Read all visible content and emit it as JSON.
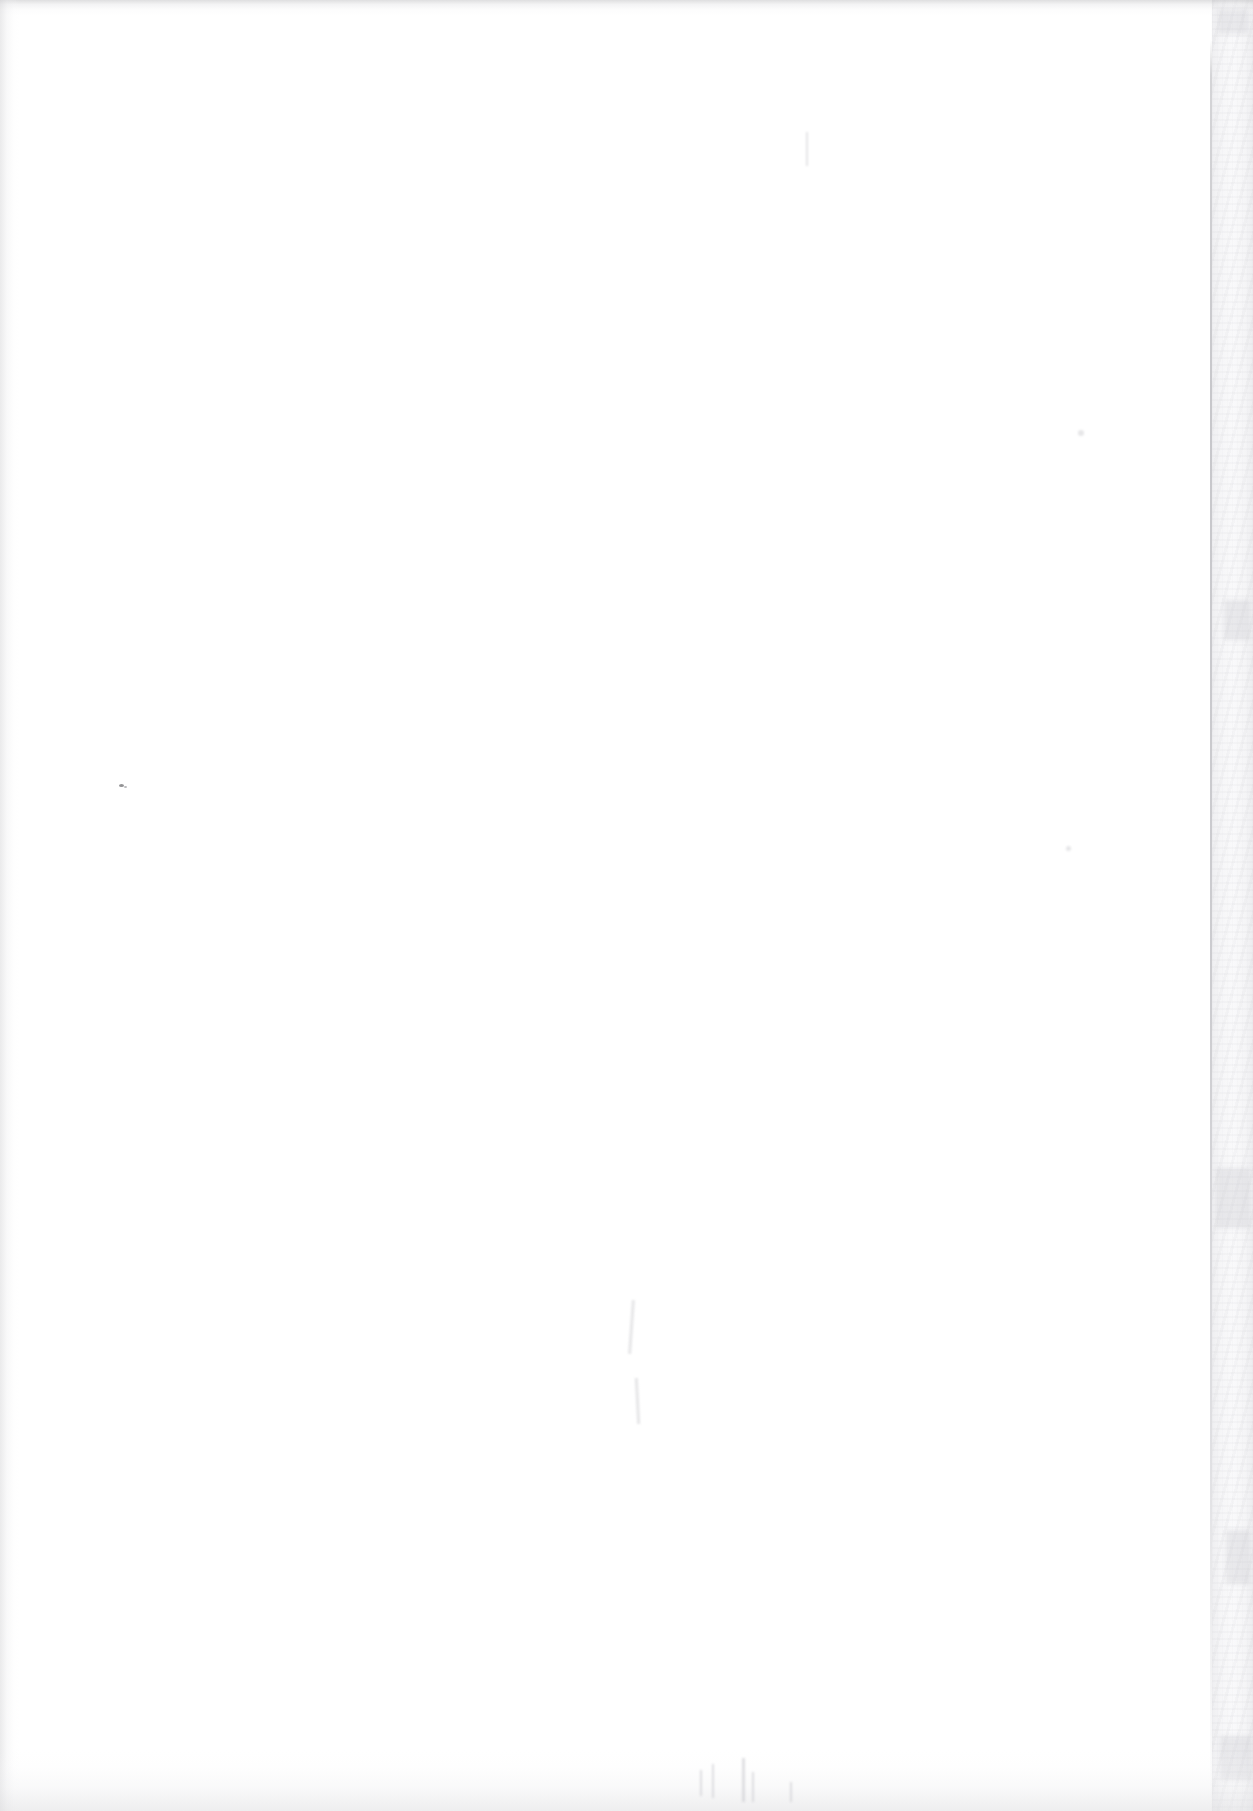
{
  "document": {
    "kind": "scanned-page",
    "content_state": "blank",
    "orientation": "portrait",
    "width_px": 1253,
    "height_px": 1811,
    "visible_text": "",
    "caption": "Blank scanned page"
  },
  "colors": {
    "paper": "#ffffff",
    "page_edge_line": "#c4c4c8",
    "edge_strip": "#eeeef0",
    "edge_shadow": "#dcdcde",
    "speck_ink": "#46464a"
  },
  "regions": {
    "paper_surface": {
      "name": "paper-surface",
      "left": 0,
      "top": 0,
      "width": 1211,
      "height": 1811
    },
    "page_edge_line": {
      "name": "page-edge-line",
      "left": 1210,
      "top": 40,
      "width": 2,
      "height": 1771
    },
    "edge_strip": {
      "name": "scanner-backing-strip",
      "left": 1212,
      "top": 0,
      "width": 41,
      "height": 1811
    },
    "edge_top": {
      "name": "top-edge-shadow",
      "height": 16
    },
    "edge_left": {
      "name": "left-edge-shadow",
      "width": 20
    },
    "edge_bottom": {
      "name": "bottom-edge-shadow",
      "height": 62
    }
  },
  "artifacts": {
    "specks": [
      {
        "left": 119,
        "top": 784,
        "w": 5,
        "h": 3,
        "opacity": 0.78
      },
      {
        "left": 124,
        "top": 786,
        "w": 3,
        "h": 2,
        "opacity": 0.5
      }
    ],
    "faint_marks": [
      {
        "left": 630,
        "top": 1300,
        "w": 3,
        "h": 54,
        "rot": 4
      },
      {
        "left": 636,
        "top": 1378,
        "w": 3,
        "h": 46,
        "rot": -3
      },
      {
        "left": 806,
        "top": 132,
        "w": 2,
        "h": 34,
        "rot": 0
      },
      {
        "left": 1078,
        "top": 430,
        "w": 6,
        "h": 6,
        "rot": 0
      },
      {
        "left": 1066,
        "top": 846,
        "w": 5,
        "h": 5,
        "rot": 0
      }
    ],
    "bottom_wisps": [
      {
        "left": 700,
        "top": 1770,
        "w": 2,
        "h": 26
      },
      {
        "left": 712,
        "top": 1764,
        "w": 2,
        "h": 34
      },
      {
        "left": 742,
        "top": 1758,
        "w": 3,
        "h": 44
      },
      {
        "left": 752,
        "top": 1772,
        "w": 2,
        "h": 30
      },
      {
        "left": 790,
        "top": 1782,
        "w": 2,
        "h": 20
      }
    ],
    "strip_patches": [
      {
        "left": 1218,
        "top": 8,
        "w": 30,
        "h": 26
      },
      {
        "left": 1224,
        "top": 600,
        "w": 26,
        "h": 40
      },
      {
        "left": 1216,
        "top": 1168,
        "w": 34,
        "h": 60
      },
      {
        "left": 1226,
        "top": 1530,
        "w": 24,
        "h": 54
      },
      {
        "left": 1220,
        "top": 1736,
        "w": 32,
        "h": 44
      }
    ]
  }
}
